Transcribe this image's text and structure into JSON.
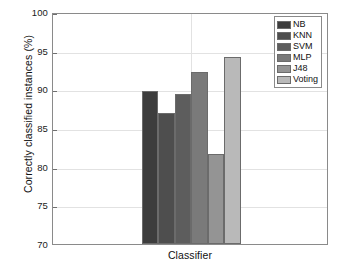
{
  "chart_data": {
    "type": "bar",
    "title": "",
    "subtitle": "",
    "xlabel": "Classifier",
    "ylabel": "Correctly classified instances (%)",
    "categories": [
      "NB",
      "KNN",
      "SVM",
      "MLP",
      "J48",
      "Voting"
    ],
    "values": [
      89.8,
      86.9,
      89.4,
      92.3,
      81.6,
      94.2
    ],
    "series": [
      {
        "name": "Correctly classified instances (%)",
        "values": [
          89.8,
          86.9,
          89.4,
          92.3,
          81.6,
          94.2
        ]
      }
    ],
    "bar_colors": [
      "#3d3d3d",
      "#4e4e4e",
      "#5d5d5d",
      "#7a7a7a",
      "#949494",
      "#b9b9b9"
    ],
    "bar_edge_color": "#6b6b6b",
    "ylim": [
      70,
      100
    ],
    "yticks": [
      70,
      75,
      80,
      85,
      90,
      95,
      100
    ],
    "ytick_labels": [
      "70",
      "75",
      "80",
      "85",
      "90",
      "95",
      "100"
    ],
    "xticks": [],
    "xtick_labels": [],
    "grid": true,
    "grid_color": "#e2e2e2",
    "legend_position": "upper right",
    "legend_entries": [
      {
        "label": "NB",
        "color": "#3d3d3d"
      },
      {
        "label": "KNN",
        "color": "#4e4e4e"
      },
      {
        "label": "SVM",
        "color": "#5d5d5d"
      },
      {
        "label": "MLP",
        "color": "#7a7a7a"
      },
      {
        "label": "J48",
        "color": "#949494"
      },
      {
        "label": "Voting",
        "color": "#b9b9b9"
      }
    ],
    "axes_color": "#8a8a8a",
    "background_color": "#ffffff"
  }
}
